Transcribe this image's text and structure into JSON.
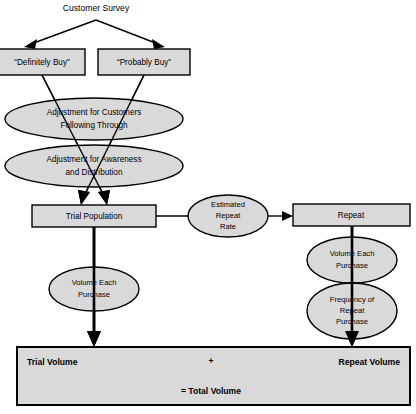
{
  "diagram": {
    "title": "Customer Survey",
    "nodes": {
      "survey": {
        "label": "Customer Survey"
      },
      "definitely_buy": {
        "label": "“Definitely Buy”"
      },
      "probably_buy": {
        "label": "“Probably Buy”"
      },
      "adjustment_following": {
        "line1": "Adjustment for Customers",
        "line2": "Following Through"
      },
      "adjustment_awareness": {
        "line1": "Adjustment for Awareness",
        "line2": "and Distribution"
      },
      "trial_population": {
        "label": "Trial Population"
      },
      "estimated_repeat_rate": {
        "line1": "Estimated",
        "line2": "Repeat",
        "line3": "Rate"
      },
      "repeat": {
        "label": "Repeat"
      },
      "volume_each_purchase_left": {
        "line1": "Volume Each",
        "line2": "Purchase"
      },
      "volume_each_purchase_right": {
        "line1": "Volume Each",
        "line2": "Purchase"
      },
      "frequency_repeat_purchase": {
        "line1": "Frequency of",
        "line2": "Repeat",
        "line3": "Purchase"
      },
      "total": {
        "trial_volume": "Trial Volume",
        "plus": "+",
        "repeat_volume": "Repeat Volume",
        "equals_total": "= Total Volume"
      }
    },
    "colors": {
      "shape_fill": "#d9d9d9",
      "stroke": "#000000",
      "background": "#ffffff"
    }
  }
}
